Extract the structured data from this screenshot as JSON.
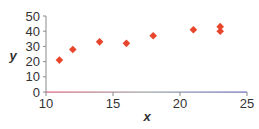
{
  "chart_data": {
    "type": "scatter",
    "title": "",
    "xlabel": "x",
    "ylabel": "y",
    "xlim": [
      10,
      25
    ],
    "ylim": [
      0,
      50
    ],
    "x_ticks": [
      10,
      15,
      20,
      25
    ],
    "y_ticks": [
      0,
      10,
      20,
      30,
      40,
      50
    ],
    "grid": false,
    "legend": null,
    "marker": "diamond",
    "marker_color": "#E8452C",
    "series": [
      {
        "name": "data",
        "points": [
          {
            "x": 11,
            "y": 21
          },
          {
            "x": 12,
            "y": 28
          },
          {
            "x": 14,
            "y": 33
          },
          {
            "x": 16,
            "y": 32
          },
          {
            "x": 18,
            "y": 37
          },
          {
            "x": 21,
            "y": 41
          },
          {
            "x": 23,
            "y": 43
          },
          {
            "x": 23,
            "y": 40
          }
        ]
      }
    ]
  },
  "axes": {
    "x_label": "x",
    "y_label": "y",
    "x_tick_labels": [
      "10",
      "15",
      "20",
      "25"
    ],
    "y_tick_labels": [
      "0",
      "10",
      "20",
      "30",
      "40",
      "50"
    ]
  },
  "colors": {
    "marker": "#E8452C",
    "axis": "#8a8a8a",
    "x_axis_start": "#d9607a",
    "x_axis_mid": "#9aa0a0",
    "x_axis_end": "#6a6ab8",
    "text": "#333333"
  }
}
